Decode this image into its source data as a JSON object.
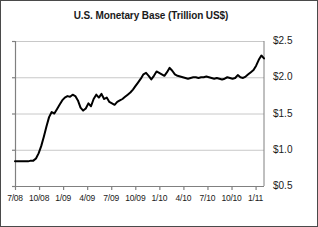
{
  "chart_data": {
    "type": "line",
    "title": "U.S. Monetary Base (Trillion US$)",
    "xlabel": "",
    "ylabel": "",
    "ylim": [
      0.5,
      2.5
    ],
    "ytick_labels": [
      "$2.5",
      "$2.0",
      "$1.5",
      "$1.0",
      "$0.5"
    ],
    "ytick_values": [
      2.5,
      2.0,
      1.5,
      1.0,
      0.5
    ],
    "xtick_labels": [
      "7/08",
      "10/08",
      "1/09",
      "4/09",
      "7/09",
      "10/09",
      "1/10",
      "4/10",
      "7/10",
      "10/10",
      "1/11"
    ],
    "grid": true,
    "legend": false,
    "line_color": "#000000",
    "grid_color": "#c8c8c8",
    "axis_color": "#808080",
    "series": [
      {
        "name": "U.S. Monetary Base",
        "values": [
          0.84,
          0.84,
          0.84,
          0.84,
          0.84,
          0.84,
          0.85,
          0.85,
          0.88,
          0.95,
          1.05,
          1.18,
          1.32,
          1.45,
          1.52,
          1.5,
          1.56,
          1.62,
          1.68,
          1.72,
          1.74,
          1.73,
          1.76,
          1.74,
          1.68,
          1.58,
          1.54,
          1.57,
          1.64,
          1.6,
          1.7,
          1.76,
          1.72,
          1.77,
          1.7,
          1.72,
          1.66,
          1.64,
          1.62,
          1.66,
          1.68,
          1.7,
          1.73,
          1.76,
          1.79,
          1.83,
          1.88,
          1.93,
          1.98,
          2.04,
          2.06,
          2.02,
          1.97,
          2.02,
          2.08,
          2.06,
          2.04,
          2.02,
          2.07,
          2.13,
          2.09,
          2.04,
          2.02,
          2.01,
          2.0,
          1.99,
          1.98,
          1.99,
          2.0,
          2.0,
          1.99,
          2.0,
          2.0,
          2.01,
          2.0,
          1.99,
          1.98,
          1.99,
          1.98,
          1.97,
          1.98,
          2.0,
          1.99,
          1.98,
          1.99,
          2.03,
          2.0,
          1.99,
          2.01,
          2.04,
          2.07,
          2.1,
          2.16,
          2.24,
          2.3,
          2.26
        ]
      }
    ]
  }
}
